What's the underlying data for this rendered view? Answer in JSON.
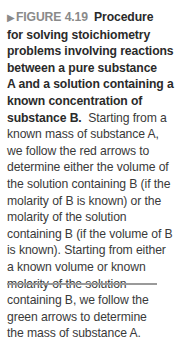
{
  "figure": {
    "marker_icon": "right-triangle-icon",
    "label": "FIGURE 4.19",
    "bold_title_lines": [
      "Procedure",
      "for solving stoichiometry",
      "problems involving reactions",
      "between a pure substance",
      "A and a solution containing a",
      "known concentration of",
      "substance B."
    ],
    "body_first": "Starting from a",
    "body_lines": [
      "known mass of substance A,",
      "we follow the red arrows to",
      "determine either the volume of",
      "the solution containing B (if the",
      "molarity of B is known) or the",
      "molarity of the solution",
      "containing B (if the volume of B",
      "is known). Starting from either",
      "a known volume or known",
      "molarity of the solution",
      "containing B, we follow the",
      "green arrows to determine",
      "the mass of substance A."
    ]
  }
}
